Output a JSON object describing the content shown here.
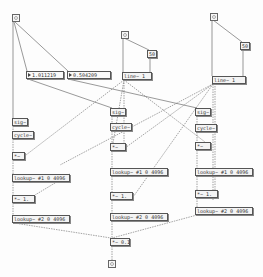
{
  "patch": {
    "bangs": [
      {
        "id": "bang-left",
        "x": 12,
        "y": 14
      },
      {
        "id": "bang-middle",
        "x": 121,
        "y": 31
      },
      {
        "id": "bang-right",
        "x": 210,
        "y": 13
      },
      {
        "id": "bang-output",
        "x": 110,
        "y": 260
      }
    ],
    "messages": {
      "msg_mid_50": "50",
      "msg_right_50": "50"
    },
    "numbers": {
      "num_a": "1.011219",
      "num_b": "0.504209"
    },
    "objects": {
      "line_mid": "line~ 1",
      "line_right": "line~ 1",
      "sig_left": "sig~",
      "sig_mid": "sig~",
      "sig_right": "sig~",
      "cycle_left": "cycle~",
      "cycle_mid": "cycle~",
      "cycle_right": "cycle~",
      "mul_left": "*~",
      "mul_mid": "*~",
      "mul_right": "*~",
      "lookup1_left": "lookup~ #1 0 4096",
      "lookup1_mid": "lookup~ #1 0 4096",
      "lookup1_right": "lookup~ #1 0 4096",
      "mul1_left": "*~ 1.",
      "mul1_mid": "*~ 1.",
      "mul1_right": "*~ 1.",
      "lookup2_left": "lookup~ #2 0 4096",
      "lookup2_mid": "lookup~ #2 0 4096",
      "lookup2_right": "lookup~ #2 0 4096",
      "gain": "*~ 0.1"
    },
    "colors": {
      "wire": "#555555",
      "signal_wire": "#666666",
      "box_border": "#555555",
      "background": "#fdfdfd"
    }
  }
}
